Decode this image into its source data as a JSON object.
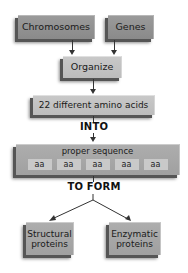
{
  "diagram": {
    "top_row": [
      {
        "label": "Chromosomes"
      },
      {
        "label": "Genes"
      }
    ],
    "organize": {
      "label": "Organize"
    },
    "amino_acids": {
      "label": "22 different amino acids"
    },
    "into_label": "INTO",
    "sequence": {
      "title": "proper sequence",
      "cells": [
        "aa",
        "aa",
        "aa",
        "aa",
        "aa"
      ]
    },
    "to_form_label": "TO FORM",
    "outputs": [
      {
        "line1": "Structural",
        "line2": "proteins"
      },
      {
        "line1": "Enzymatic",
        "line2": "proteins"
      }
    ]
  }
}
